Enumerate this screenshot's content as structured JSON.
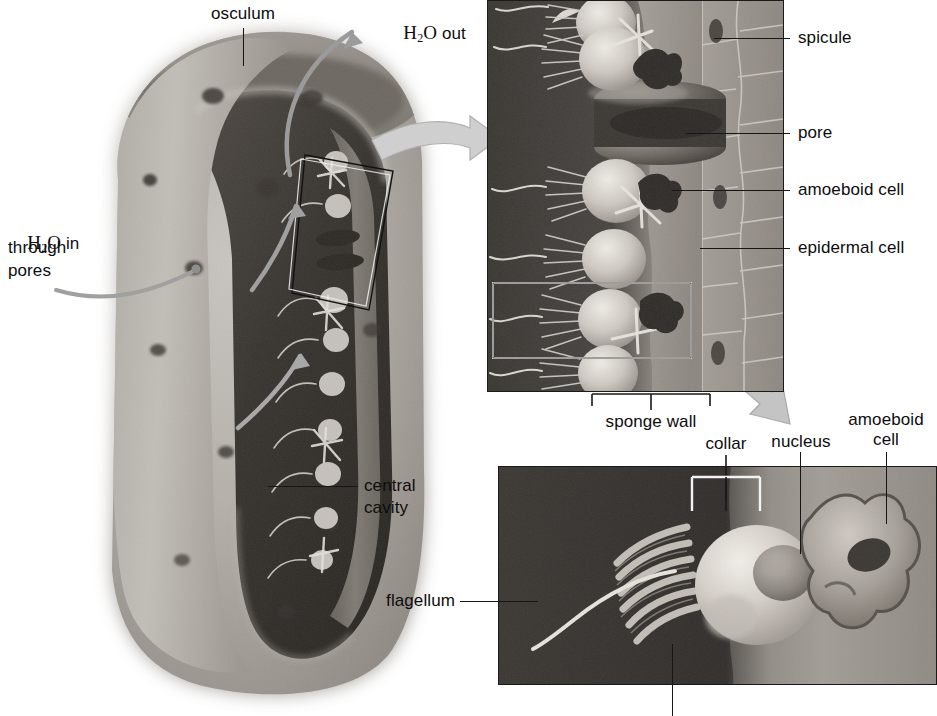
{
  "figure": {
    "ink": "#111111",
    "arrow_gray": "#9a9a9a",
    "panel_border": "#1a1a1a"
  },
  "overview": {
    "osculum_label": "osculum",
    "water_out": {
      "formula": "H",
      "sub": "2",
      "formula_tail": "O",
      "rest": " out"
    },
    "water_in": {
      "formula": "H",
      "sub": "2",
      "formula_tail": "O",
      "rest": " in",
      "line2": "through",
      "line3": "pores"
    },
    "central_cavity_line1": "central",
    "central_cavity_line2": "cavity"
  },
  "wall_panel": {
    "labels": [
      {
        "id": "spicule",
        "text": "spicule"
      },
      {
        "id": "pore",
        "text": "pore"
      },
      {
        "id": "amoeboid-cell",
        "text": "amoeboid cell"
      },
      {
        "id": "epidermal-cell",
        "text": "epidermal cell"
      }
    ],
    "bracket_label": "sponge wall"
  },
  "cell_panel": {
    "collar_label": "collar",
    "nucleus_label": "nucleus",
    "amoeboid_cell_line1": "amoeboid",
    "amoeboid_cell_line2": "cell",
    "flagellum_label": "flagellum"
  }
}
